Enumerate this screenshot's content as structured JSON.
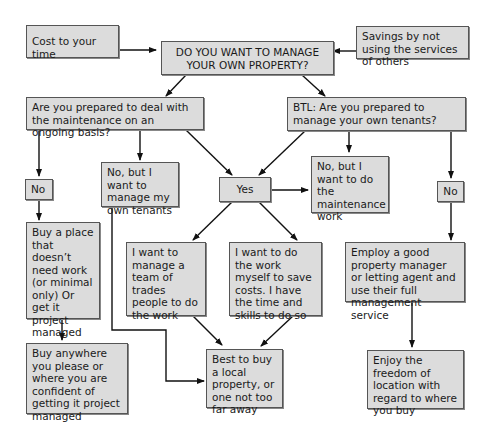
{
  "nodes": {
    "cost_time": "Cost to your time",
    "main_question": "DO YOU WANT TO MANAGE YOUR OWN PROPERTY?",
    "savings": "Savings by not using the services of others",
    "maintenance_question": "Are you prepared to deal with the maintenance on an ongoing basis?",
    "btl_question": "BTL:  Are you prepared to manage your own tenants?",
    "no_left": "No",
    "no_manage_tenants": "No, but I want to manage my own tenants",
    "yes": "Yes",
    "no_maintenance_work": "No, but I want to do the maintenance work",
    "no_right": "No",
    "buy_no_work": "Buy a place that doesn’t need work (or minimal only) Or get it project managed",
    "manage_trades": "I want to manage a team of trades people to do the work",
    "do_work_myself": "I want to do the work myself to save costs. I have the time and skills to do so",
    "employ_manager": "Employ a good property manager or letting agent and use their full management service",
    "buy_anywhere": "Buy anywhere you please or where you are confident of getting it project managed",
    "buy_local": "Best to buy a local property, or one not too far away",
    "enjoy_freedom": "Enjoy the freedom of location with regard to where you buy"
  }
}
